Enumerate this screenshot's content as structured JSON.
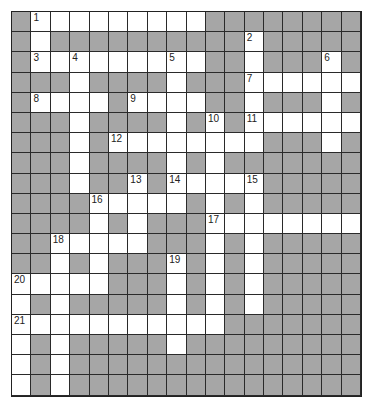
{
  "puzzle": {
    "type": "crossword",
    "columns": 18,
    "rows": 19,
    "colors": {
      "block": "#a6a6a6",
      "open": "#ffffff",
      "line": "#222222"
    },
    "layout": [
      "#.........########",
      "#.##########.#####",
      "#.........##.###.#",
      "###.####.###......",
      "#....#....##.###.#",
      "###.####.#.#......",
      "###.#........###.#",
      "###.####.#.#######",
      "###.##.#.....#####",
      "####.....#.#.#####",
      "####.#.###........",
      "##.....###.#.#####",
      "##.#.###.#.#.#####",
      ".....###.#.#.#####",
      ".#.#####.#.#.#####",
      "...........#######",
      ".#.#####.#########",
      ".#.###############",
      ".#.###############"
    ],
    "numbers": [
      {
        "n": "1",
        "r": 0,
        "c": 1
      },
      {
        "n": "2",
        "r": 1,
        "c": 12
      },
      {
        "n": "3",
        "r": 2,
        "c": 1
      },
      {
        "n": "4",
        "r": 2,
        "c": 3
      },
      {
        "n": "5",
        "r": 2,
        "c": 8
      },
      {
        "n": "6",
        "r": 2,
        "c": 16
      },
      {
        "n": "7",
        "r": 3,
        "c": 12
      },
      {
        "n": "8",
        "r": 4,
        "c": 1
      },
      {
        "n": "9",
        "r": 4,
        "c": 6
      },
      {
        "n": "10",
        "r": 5,
        "c": 10
      },
      {
        "n": "11",
        "r": 5,
        "c": 12
      },
      {
        "n": "12",
        "r": 6,
        "c": 5
      },
      {
        "n": "13",
        "r": 8,
        "c": 6
      },
      {
        "n": "14",
        "r": 8,
        "c": 8
      },
      {
        "n": "15",
        "r": 8,
        "c": 12
      },
      {
        "n": "16",
        "r": 9,
        "c": 4
      },
      {
        "n": "17",
        "r": 10,
        "c": 10
      },
      {
        "n": "18",
        "r": 11,
        "c": 2
      },
      {
        "n": "19",
        "r": 12,
        "c": 8
      },
      {
        "n": "20",
        "r": 13,
        "c": 0
      },
      {
        "n": "21",
        "r": 15,
        "c": 0
      }
    ]
  }
}
